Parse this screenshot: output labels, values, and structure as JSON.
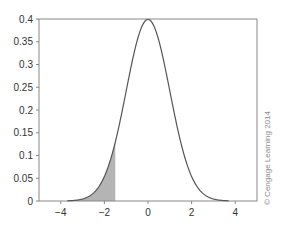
{
  "chart_data": {
    "type": "area",
    "title": "",
    "xlabel": "",
    "ylabel": "",
    "xlim": [
      -5,
      5
    ],
    "ylim": [
      0,
      0.4
    ],
    "x_ticks": [
      -4,
      -2,
      0,
      2,
      4
    ],
    "x_tick_labels": [
      "−4",
      "−2",
      "0",
      "2",
      "4"
    ],
    "y_ticks": [
      0,
      0.05,
      0.1,
      0.15,
      0.2,
      0.25,
      0.3,
      0.35,
      0.4
    ],
    "y_tick_labels": [
      "0",
      "0.05",
      "0.1",
      "0.15",
      "0.2",
      "0.25",
      "0.3",
      "0.35",
      "0.4"
    ],
    "grid": false,
    "legend": null,
    "series": [
      {
        "name": "Standard normal density",
        "kind": "line",
        "x": [
          -4,
          -3.5,
          -3,
          -2.5,
          -2,
          -1.5,
          -1,
          -0.5,
          0,
          0.5,
          1,
          1.5,
          2,
          2.5,
          3,
          3.5,
          4
        ],
        "values": [
          0.0001,
          0.0009,
          0.0044,
          0.0175,
          0.054,
          0.1295,
          0.242,
          0.3521,
          0.3989,
          0.3521,
          0.242,
          0.1295,
          0.054,
          0.0175,
          0.0044,
          0.0009,
          0.0001
        ]
      }
    ],
    "shaded_region": {
      "from": -5,
      "to": -1.5,
      "description": "left tail area under curve"
    },
    "annotations": [
      "© Cengage Learning 2014"
    ]
  },
  "colors": {
    "curve": "#555555",
    "axis": "#888888",
    "shade": "#b4b4b4"
  },
  "credit": "© Cengage Learning 2014"
}
